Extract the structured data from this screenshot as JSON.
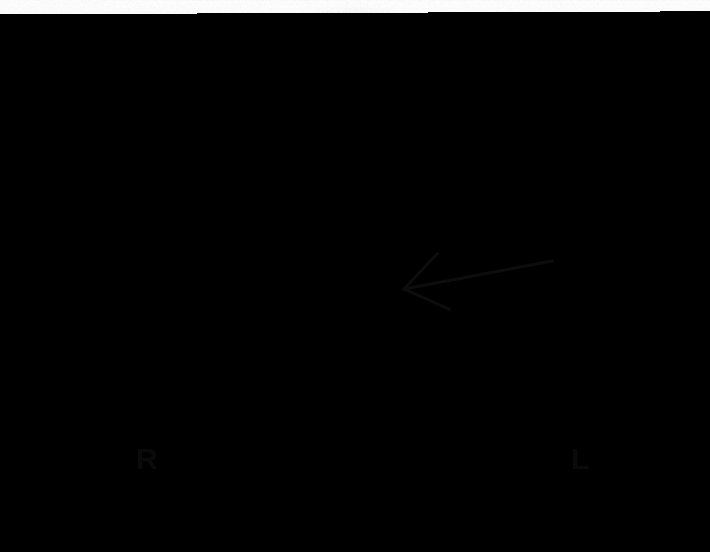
{
  "image": {
    "title": "Anterior whole-body radioiodine scintigraphy of head, neck and upper thorax",
    "modality": "nuclear-medicine-scintigraphy",
    "view": "anterior",
    "width": 710,
    "height": 552,
    "background_color": "#fcfcfc",
    "ink_color": "#0a0a0a"
  },
  "annotations": {
    "orientation_right": {
      "label": "R",
      "x": 136,
      "y": 444
    },
    "orientation_left": {
      "label": "L",
      "x": 571,
      "y": 444
    },
    "arrow": {
      "name": "focal-uptake-arrow",
      "tip_x": 404,
      "tip_y": 289,
      "tail_x": 552,
      "tail_y": 261,
      "barb_upper_x": 437,
      "barb_upper_y": 254,
      "barb_lower_x": 449,
      "barb_lower_y": 309,
      "stroke_width": 3,
      "color": "#0d0d0d"
    }
  },
  "anatomy": {
    "head": {
      "cx": 355,
      "cy": 165,
      "rx": 128,
      "ry": 128,
      "intensity": 0.3
    },
    "neck": {
      "cx": 345,
      "cy": 300,
      "rx": 95,
      "ry": 110,
      "intensity": 0.34
    },
    "shoulders": {
      "cx": 355,
      "cy": 470,
      "rx": 232,
      "ry": 118,
      "intensity": 0.4
    },
    "midline_structure": {
      "cx": 328,
      "cy": 218,
      "rx": 26,
      "ry": 38,
      "intensity": 0.52,
      "name": "thyroid-bed-remnant"
    },
    "focal_hot_nodule": {
      "cx": 373,
      "cy": 292,
      "r_core": 7,
      "r_halo": 27,
      "intensity": 1.0,
      "name": "focal-metastatic-uptake"
    },
    "mediastinal_uptake": {
      "cx": 336,
      "cy": 470,
      "rx": 28,
      "ry": 62,
      "intensity": 0.95,
      "name": "sternal-mediastinal-uptake"
    },
    "sub_nodule_ring": {
      "cx": 296,
      "cy": 285,
      "rx": 34,
      "ry": 20,
      "intensity": 0.22
    }
  },
  "chart_data": {
    "type": "heatmap",
    "xlabel": "",
    "ylabel": "",
    "colormap": "grayscale-inverted",
    "legend_entries": [
      "R = patient right",
      "L = patient left"
    ],
    "annotations": [
      "Arrow indicates focal intense uptake in the left lower neck"
    ],
    "regions": [
      {
        "name": "head",
        "relative_uptake": 0.3
      },
      {
        "name": "neck",
        "relative_uptake": 0.34
      },
      {
        "name": "thyroid-bed-remnant",
        "relative_uptake": 0.52
      },
      {
        "name": "focal-metastatic-uptake",
        "relative_uptake": 1.0
      },
      {
        "name": "shoulders",
        "relative_uptake": 0.4
      },
      {
        "name": "sternal-mediastinal-uptake",
        "relative_uptake": 0.95
      },
      {
        "name": "background",
        "relative_uptake": 0.02
      }
    ]
  }
}
